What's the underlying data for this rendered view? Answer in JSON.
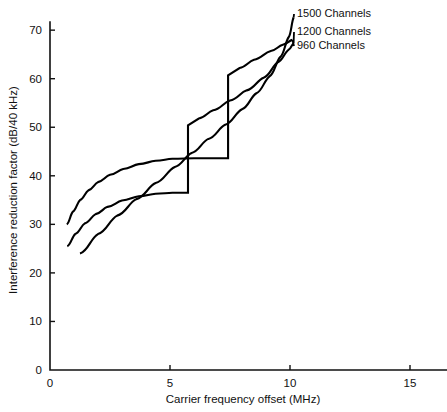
{
  "chart_data": {
    "type": "line",
    "title": "",
    "xlabel": "Carrier frequency offset (MHz)",
    "ylabel": "Interference reduction factor (dB/40 kHz)",
    "xlim": [
      0,
      16
    ],
    "ylim": [
      0,
      76
    ],
    "xticks": [
      0,
      5,
      10,
      15
    ],
    "yticks": [
      0,
      10,
      20,
      30,
      40,
      50,
      60,
      70
    ],
    "xtick_labels": [
      "0",
      "5",
      "10",
      "15"
    ],
    "ytick_labels": [
      "0",
      "10",
      "20",
      "30",
      "40",
      "50",
      "60",
      "70"
    ],
    "grid": false,
    "legend_position": "upper-right-inline-labels",
    "series": [
      {
        "name": "960 Channels",
        "label": "960 Channels",
        "color": "#000000",
        "points": [
          [
            0.7,
            30.0
          ],
          [
            0.95,
            32.6
          ],
          [
            1.25,
            35.0
          ],
          [
            1.6,
            37.0
          ],
          [
            2.0,
            38.7
          ],
          [
            2.5,
            40.2
          ],
          [
            3.05,
            41.4
          ],
          [
            3.7,
            42.4
          ],
          [
            4.4,
            43.1
          ],
          [
            5.1,
            43.5
          ],
          [
            6.0,
            43.6
          ],
          [
            7.0,
            43.6
          ],
          [
            7.42,
            43.6
          ],
          [
            7.42,
            60.7
          ],
          [
            7.9,
            62.2
          ],
          [
            8.5,
            63.9
          ],
          [
            9.2,
            65.7
          ],
          [
            9.7,
            67.0
          ],
          [
            10.1,
            68.0
          ]
        ]
      },
      {
        "name": "1200 Channels",
        "label": "1200 Channels",
        "color": "#000000",
        "points": [
          [
            0.72,
            25.5
          ],
          [
            1.05,
            28.0
          ],
          [
            1.45,
            30.2
          ],
          [
            1.9,
            32.1
          ],
          [
            2.4,
            33.6
          ],
          [
            3.0,
            34.9
          ],
          [
            3.7,
            35.8
          ],
          [
            4.4,
            36.3
          ],
          [
            5.1,
            36.5
          ],
          [
            5.75,
            36.5
          ],
          [
            5.75,
            50.4
          ],
          [
            6.2,
            51.8
          ],
          [
            6.8,
            53.5
          ],
          [
            7.5,
            55.5
          ],
          [
            8.2,
            57.6
          ],
          [
            8.9,
            60.2
          ],
          [
            9.5,
            63.4
          ],
          [
            9.95,
            66.0
          ],
          [
            10.15,
            67.3
          ]
        ]
      },
      {
        "name": "1500 Channels",
        "label": "1500 Channels",
        "color": "#000000",
        "points": [
          [
            1.25,
            24.0
          ],
          [
            2.0,
            28.0
          ],
          [
            2.8,
            31.8
          ],
          [
            3.6,
            35.2
          ],
          [
            4.4,
            38.5
          ],
          [
            5.2,
            41.8
          ],
          [
            5.9,
            44.7
          ],
          [
            6.6,
            47.6
          ],
          [
            7.3,
            50.5
          ],
          [
            8.0,
            53.7
          ],
          [
            8.6,
            57.0
          ],
          [
            9.15,
            60.5
          ],
          [
            9.6,
            64.5
          ],
          [
            9.95,
            68.6
          ],
          [
            10.15,
            72.6
          ]
        ]
      }
    ],
    "annotations": [
      {
        "text": "1500 Channels",
        "data_anchor": [
          10.15,
          72.6
        ],
        "label_x": 297,
        "label_y": 17
      },
      {
        "text": "1200 Channels",
        "data_anchor": [
          10.15,
          67.3
        ],
        "label_x": 297,
        "label_y": 35
      },
      {
        "text": "960 Channels",
        "data_anchor": [
          10.1,
          68.0
        ],
        "label_x": 297,
        "label_y": 49
      }
    ]
  },
  "axes": {
    "x_axis_title": "Carrier frequency offset (MHz)",
    "y_axis_title": "Interference reduction factor (dB/40 kHz)"
  }
}
